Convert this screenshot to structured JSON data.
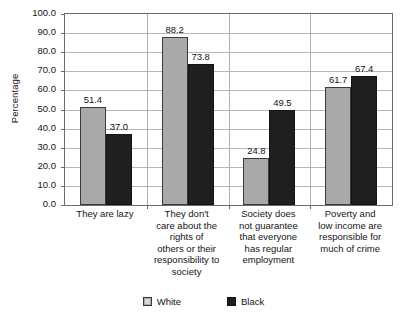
{
  "chart_data": {
    "type": "bar",
    "title": "",
    "xlabel": "",
    "ylabel": "Percentage",
    "ylim": [
      0,
      100
    ],
    "ytick_step": 10,
    "grid": true,
    "legend_position": "bottom",
    "categories": [
      "They are lazy",
      "They don't care about the rights of others or their responsibility to society",
      "Society does not guarantee that everyone has regular employment",
      "Poverty and low income are responsible for much of crime"
    ],
    "category_lines": [
      [
        "They are lazy"
      ],
      [
        "They don't",
        "care about the",
        "rights of",
        "others or their",
        "responsibility to",
        "society"
      ],
      [
        "Society does",
        "not guarantee",
        "that everyone",
        "has regular",
        "employment"
      ],
      [
        "Poverty and",
        "low income are",
        "responsible for",
        "much of crime"
      ]
    ],
    "series": [
      {
        "name": "White",
        "color": "#a9a9a9",
        "values": [
          51.4,
          88.2,
          24.8,
          61.7
        ]
      },
      {
        "name": "Black",
        "color": "#1f1f1f",
        "values": [
          37.0,
          73.8,
          49.5,
          67.4
        ]
      }
    ],
    "value_labels": [
      [
        "51.4",
        "37.0"
      ],
      [
        "88.2",
        "73.8"
      ],
      [
        "24.8",
        "49.5"
      ],
      [
        "61.7",
        "67.4"
      ]
    ],
    "ytick_labels": [
      "100.0",
      "90.0",
      "80.0",
      "70.0",
      "60.0",
      "50.0",
      "40.0",
      "30.0",
      "20.0",
      "10.0",
      "0.0"
    ],
    "ytick_values": [
      100,
      90,
      80,
      70,
      60,
      50,
      40,
      30,
      20,
      10,
      0
    ]
  },
  "legend": {
    "items": [
      {
        "label": "White",
        "swatch": "gray-square-swatch"
      },
      {
        "label": "Black",
        "swatch": "black-square-swatch"
      }
    ]
  }
}
